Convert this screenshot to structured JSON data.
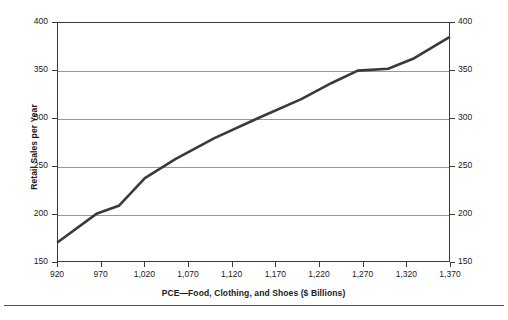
{
  "chart_data": {
    "type": "line",
    "title": "",
    "xlabel": "PCE—Food, Clothing, and Shoes ($ Billions)",
    "ylabel": "Retail Sales per Year",
    "ylabel_right": "Retail Sales per Year",
    "xlim": [
      920,
      1370
    ],
    "ylim": [
      150,
      400
    ],
    "xticks": [
      920,
      970,
      1020,
      1070,
      1120,
      1170,
      1220,
      1270,
      1320,
      1370
    ],
    "xtick_labels": [
      "920",
      "970",
      "1,020",
      "1,070",
      "1,120",
      "1,170",
      "1,220",
      "1,270",
      "1,320",
      "1,370"
    ],
    "yticks": [
      150,
      200,
      250,
      300,
      350,
      400
    ],
    "ytick_labels": [
      "150",
      "200",
      "250",
      "300",
      "350",
      "400"
    ],
    "ytick_labels_right": [
      "150",
      "200",
      "250",
      "300",
      "350",
      "400"
    ],
    "gridlines_y": [
      200,
      250,
      300,
      350
    ],
    "grid": "horizontal-only",
    "legend": "none",
    "line_color": "#3a3a3a",
    "line_width": 2.6,
    "series": [
      {
        "name": "Retail Sales per Year",
        "x": [
          920,
          965,
          990,
          1020,
          1055,
          1100,
          1150,
          1200,
          1235,
          1265,
          1300,
          1330,
          1370
        ],
        "values": [
          170,
          200,
          208,
          237,
          257,
          279,
          300,
          320,
          337,
          350,
          352,
          363,
          385
        ]
      }
    ]
  },
  "axes": {
    "x_title": "PCE—Food, Clothing, and Shoes ($ Billions)",
    "y_title": "Retail Sales per Year"
  }
}
